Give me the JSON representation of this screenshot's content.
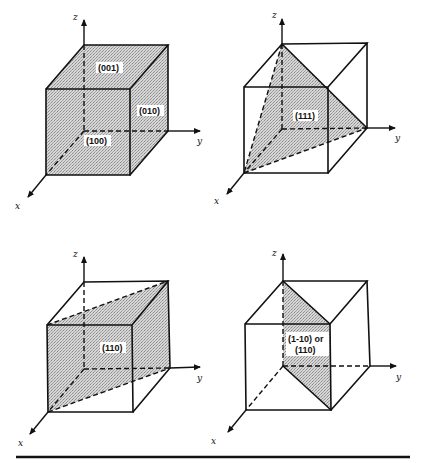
{
  "figure": {
    "axes_labels": {
      "x": "x",
      "y": "y",
      "z": "z"
    },
    "panels": [
      {
        "id": "panel-1",
        "planes": [
          "(001)",
          "(010)",
          "(100)"
        ],
        "labels": {
          "top": "(001)",
          "side": "(010)",
          "front": "(100)"
        }
      },
      {
        "id": "panel-2",
        "planes": [
          "(111)"
        ],
        "labels": {
          "plane": "(111)"
        }
      },
      {
        "id": "panel-3",
        "planes": [
          "(110)"
        ],
        "labels": {
          "plane": "(110)"
        }
      },
      {
        "id": "panel-4",
        "planes": [
          "(1-10)",
          "(110)"
        ],
        "labels": {
          "line1": "(1-10) or",
          "line2": "(110)"
        }
      }
    ]
  },
  "colors": {
    "line": "#111111",
    "shade": "#c8c8c8",
    "background": "#ffffff"
  }
}
